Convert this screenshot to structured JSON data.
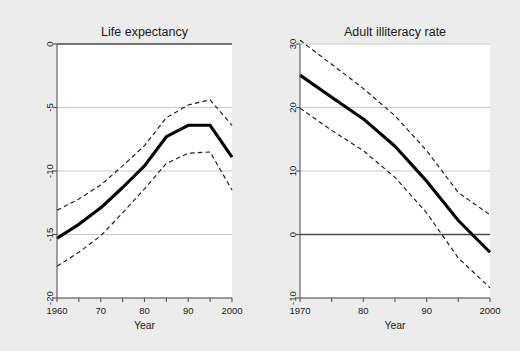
{
  "figure": {
    "background_color": "#ececec",
    "plot_background_color": "#ffffff",
    "grid_color": "#c8c8c8",
    "line_color": "#000000"
  },
  "chart_data": [
    {
      "type": "line",
      "title": "Life expectancy",
      "xlabel": "Year",
      "ylabel": "",
      "xlim": [
        1960,
        2000
      ],
      "ylim": [
        -20,
        0
      ],
      "grid": true,
      "legend": "none",
      "xticks": [
        1960,
        1965,
        1970,
        1975,
        1980,
        1985,
        1990,
        1995,
        2000
      ],
      "xticklabels": [
        "1960",
        "",
        "70",
        "",
        "80",
        "",
        "90",
        "",
        "2000"
      ],
      "yticks": [
        0,
        -5,
        -10,
        -15,
        -20
      ],
      "yticklabels": [
        "0",
        "-5",
        "-10",
        "-15",
        "-20"
      ],
      "x": [
        1960,
        1965,
        1970,
        1975,
        1980,
        1985,
        1990,
        1995,
        2000
      ],
      "series": [
        {
          "name": "estimate",
          "style": "solid",
          "values": [
            -15.3,
            -14.2,
            -12.9,
            -11.3,
            -9.6,
            -7.3,
            -6.4,
            -6.4,
            -8.9
          ]
        },
        {
          "name": "upper confidence bound",
          "style": "dashed",
          "values": [
            -13.1,
            -12.2,
            -11.1,
            -9.6,
            -8.0,
            -5.8,
            -4.8,
            -4.4,
            -6.4
          ]
        },
        {
          "name": "lower confidence bound",
          "style": "dashed",
          "values": [
            -17.5,
            -16.4,
            -15.1,
            -13.3,
            -11.4,
            -9.4,
            -8.6,
            -8.5,
            -11.5
          ]
        }
      ]
    },
    {
      "type": "line",
      "title": "Adult illiteracy rate",
      "xlabel": "Year",
      "ylabel": "",
      "xlim": [
        1970,
        2000
      ],
      "ylim": [
        -10,
        30
      ],
      "grid": true,
      "legend": "none",
      "xticks": [
        1970,
        1975,
        1980,
        1985,
        1990,
        1995,
        2000
      ],
      "xticklabels": [
        "1970",
        "",
        "80",
        "",
        "90",
        "",
        "2000"
      ],
      "yticks": [
        30,
        20,
        10,
        0,
        -10
      ],
      "yticklabels": [
        "30",
        "20",
        "10",
        "0",
        "-10"
      ],
      "x": [
        1970,
        1975,
        1980,
        1985,
        1990,
        1995,
        2000
      ],
      "series": [
        {
          "name": "estimate",
          "style": "solid",
          "values": [
            25.1,
            21.6,
            18.2,
            13.9,
            8.4,
            2.2,
            -2.8
          ]
        },
        {
          "name": "upper confidence bound",
          "style": "dashed",
          "values": [
            30.6,
            26.8,
            23.0,
            18.7,
            13.2,
            6.6,
            3.1
          ]
        },
        {
          "name": "lower confidence bound",
          "style": "dashed",
          "values": [
            19.9,
            16.4,
            13.2,
            9.0,
            3.4,
            -3.7,
            -8.4
          ]
        }
      ]
    }
  ]
}
